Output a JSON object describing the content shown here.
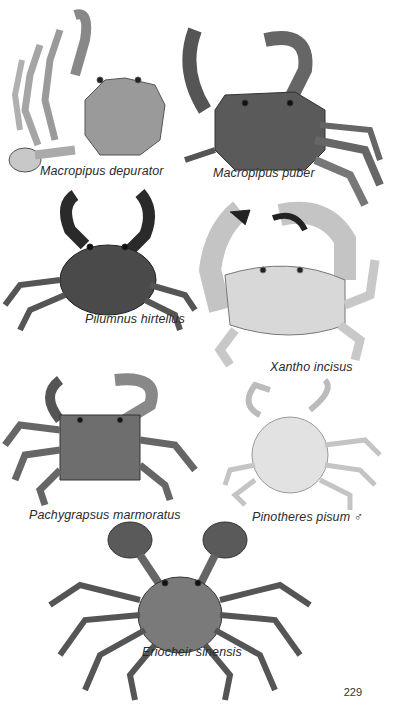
{
  "page": {
    "number": "229",
    "background": "#ffffff",
    "ink_color": "#2a2a2a"
  },
  "plates": [
    {
      "id": "macropipus-depurator",
      "caption": "Macropipus depurator",
      "icon": "crab-illustration"
    },
    {
      "id": "macropipus-puber",
      "caption": "Macropipus puber",
      "icon": "crab-illustration"
    },
    {
      "id": "pilumnus-hirtellus",
      "caption": "Pilumnus hirtellus",
      "icon": "crab-illustration"
    },
    {
      "id": "xantho-incisus",
      "caption": "Xantho incisus",
      "icon": "crab-illustration"
    },
    {
      "id": "pachygrapsus-marmoratus",
      "caption": "Pachygrapsus marmoratus",
      "icon": "crab-illustration"
    },
    {
      "id": "pinotheres-pisum",
      "caption": "Pinotheres pisum ♂",
      "icon": "crab-illustration"
    },
    {
      "id": "eriocheir-sinensis",
      "caption": "Eriocheir sinensis",
      "icon": "crab-illustration"
    }
  ]
}
